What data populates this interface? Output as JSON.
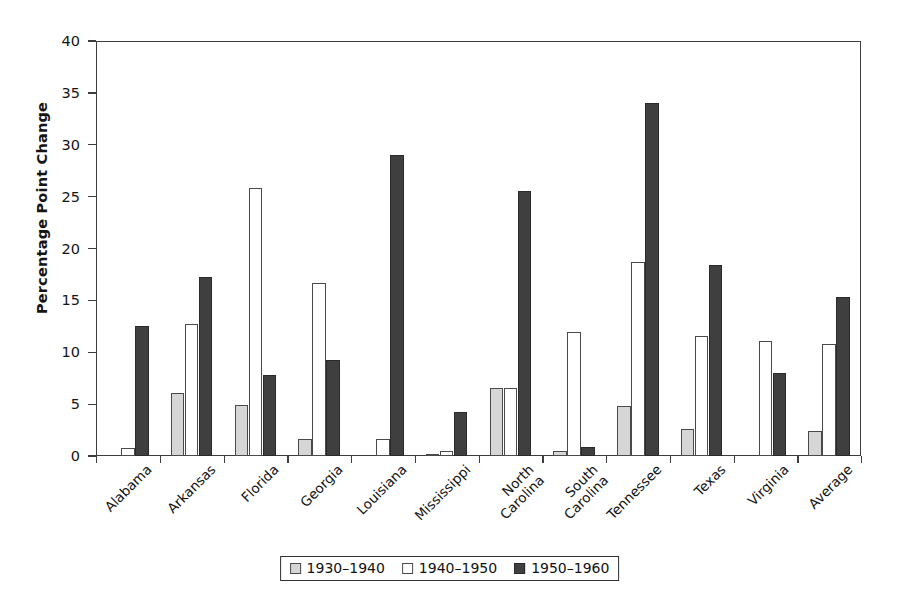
{
  "chart_data": {
    "type": "bar",
    "title": "",
    "xlabel": "",
    "ylabel": "Percentage Point Change",
    "ylim": [
      0,
      40
    ],
    "ytick_step": 5,
    "yticks": [
      0,
      5,
      10,
      15,
      20,
      25,
      30,
      35,
      40
    ],
    "grid": false,
    "legend_position": "bottom-center",
    "categories": [
      "Alabama",
      "Arkansas",
      "Florida",
      "Georgia",
      "Louisiana",
      "Mississippi",
      "North Carolina",
      "South Carolina",
      "Tennessee",
      "Texas",
      "Virginia",
      "Average"
    ],
    "category_lines": [
      [
        "Alabama"
      ],
      [
        "Arkansas"
      ],
      [
        "Florida"
      ],
      [
        "Georgia"
      ],
      [
        "Louisiana"
      ],
      [
        "Mississippi"
      ],
      [
        "North",
        "Carolina"
      ],
      [
        "South",
        "Carolina"
      ],
      [
        "Tennessee"
      ],
      [
        "Texas"
      ],
      [
        "Virginia"
      ],
      [
        "Average"
      ]
    ],
    "series": [
      {
        "name": "1930–1940",
        "color": "#d6d6d6",
        "values": [
          0,
          6.1,
          4.9,
          1.6,
          0,
          0.2,
          6.6,
          0.5,
          4.8,
          2.6,
          0,
          2.4
        ]
      },
      {
        "name": "1940–1950",
        "color": "#ffffff",
        "values": [
          0.8,
          12.7,
          25.8,
          16.7,
          1.6,
          0.5,
          6.6,
          12.0,
          18.7,
          11.6,
          11.1,
          10.8
        ]
      },
      {
        "name": "1950–1960",
        "color": "#3f3f3f",
        "values": [
          12.5,
          17.3,
          7.8,
          9.3,
          29.0,
          4.2,
          25.5,
          0.9,
          34.0,
          18.4,
          8.0,
          15.3
        ]
      }
    ]
  },
  "axis": {
    "y_title": "Percentage Point Change"
  },
  "legend": {
    "items": [
      {
        "label": "1930–1940",
        "swatch": "light-gray"
      },
      {
        "label": "1940–1950",
        "swatch": "white"
      },
      {
        "label": "1950–1960",
        "swatch": "dark-gray"
      }
    ]
  }
}
